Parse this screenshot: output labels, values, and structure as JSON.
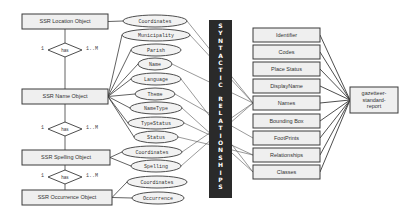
{
  "entities": [
    {
      "id": "location",
      "label": "SSR Location Object"
    },
    {
      "id": "name",
      "label": "SSR Name Object"
    },
    {
      "id": "spelling",
      "label": "SSR Spelling Object"
    },
    {
      "id": "occurrence",
      "label": "SSR Occurrence Object"
    }
  ],
  "relationships": [
    {
      "label": "has",
      "left_card": "1",
      "right_card": "1..M"
    },
    {
      "label": "has",
      "left_card": "1",
      "right_card": "1..M"
    },
    {
      "label": "has",
      "left_card": "1",
      "right_card": "1..M"
    }
  ],
  "attributes": {
    "location": [
      "Coordinates"
    ],
    "name": [
      "Municipality",
      "Parish",
      "Name",
      "Language",
      "Theme",
      "NameType",
      "TypeStatus",
      "Status"
    ],
    "spelling": [
      "Coordinates",
      "Spelling"
    ],
    "occurrence": [
      "Coordinates",
      "Occurrence"
    ]
  },
  "syntactic_bar": {
    "label": "SYNTACTIC RELATIONSHIPS",
    "color": "#2a2a2a"
  },
  "report_fields": [
    "Identifier",
    "Codes",
    "Place Status",
    "DisplayName",
    "Names",
    "Bounding Box",
    "FootPrints",
    "Relationships",
    "Classes"
  ],
  "report": {
    "lines": [
      "gazetteer-",
      "standard-",
      "report"
    ]
  },
  "colors": {
    "box_fill": "#efefef",
    "stroke": "#3a3a3a",
    "ellipse_fill": "#f2f2f2"
  }
}
